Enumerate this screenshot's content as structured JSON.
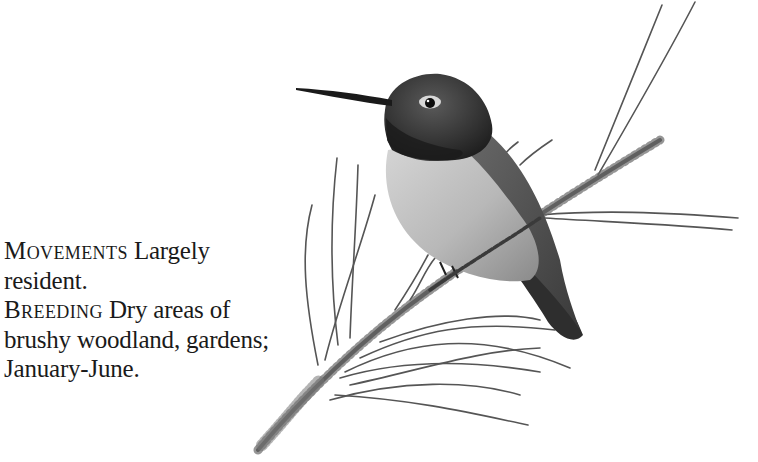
{
  "illustration": {
    "subject": "hummingbird perched on pine twig",
    "style": "grayscale pencil drawing"
  },
  "entries": [
    {
      "heading": "Movements",
      "body": " Largely resident."
    },
    {
      "heading": "Breeding",
      "body": " Dry areas of brushy woodland, gardens; January-June."
    }
  ],
  "colors": {
    "background": "#ffffff",
    "text": "#1a1a1a",
    "bird_dark": "#2a2a2a",
    "bird_mid": "#7a7a7a",
    "bird_light": "#c8c8c8",
    "twig": "#4a4a4a"
  }
}
